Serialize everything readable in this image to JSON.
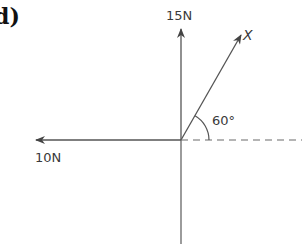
{
  "part_label": "d)",
  "origin": {
    "x": 181,
    "y": 140
  },
  "forces": [
    {
      "id": "up",
      "label": "15 N",
      "magnitude_text": "15N",
      "direction": "up"
    },
    {
      "id": "left",
      "label": "10 N",
      "magnitude_text": "10N",
      "direction": "left"
    },
    {
      "id": "x",
      "label": "X",
      "magnitude_text": "X",
      "angle_deg": 60,
      "direction": "up-right"
    }
  ],
  "angle": {
    "value": "60°",
    "between": [
      "horizontal reference",
      "X"
    ]
  },
  "reference_line": {
    "style": "dashed",
    "direction": "right"
  },
  "colors": {
    "line": "#555555",
    "dash": "#6a6a6a",
    "text": "#3a3a3a"
  }
}
